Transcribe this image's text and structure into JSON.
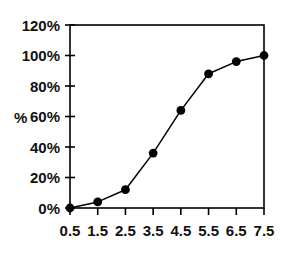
{
  "chart_data": {
    "type": "line",
    "title": "",
    "subtitle": "",
    "xlabel": "",
    "ylabel": "%",
    "x": [
      0.5,
      1.5,
      2.5,
      3.5,
      4.5,
      5.5,
      6.5,
      7.5
    ],
    "values": [
      0,
      4,
      12,
      36,
      64,
      88,
      96,
      100
    ],
    "series": [
      {
        "name": "",
        "values": [
          0,
          4,
          12,
          36,
          64,
          88,
          96,
          100
        ]
      }
    ],
    "x_tick_labels": [
      "0.5",
      "1.5",
      "2.5",
      "3.5",
      "4.5",
      "5.5",
      "6.5",
      "7.5"
    ],
    "y_tick_labels": [
      "0%",
      "20%",
      "40%",
      "60%",
      "80%",
      "100%",
      "120%"
    ],
    "y_tick_values": [
      0,
      20,
      40,
      60,
      80,
      100,
      120
    ],
    "xlim": [
      0.5,
      7.5
    ],
    "ylim": [
      0,
      120
    ],
    "grid": false,
    "legend": false,
    "legend_position": "none",
    "line_color": "#000000",
    "marker_color": "#000000",
    "marker_shape": "circle",
    "axis_color": "#000000",
    "background_color": "#ffffff",
    "annotations": []
  },
  "axes": {
    "y_axis_title": "%"
  }
}
